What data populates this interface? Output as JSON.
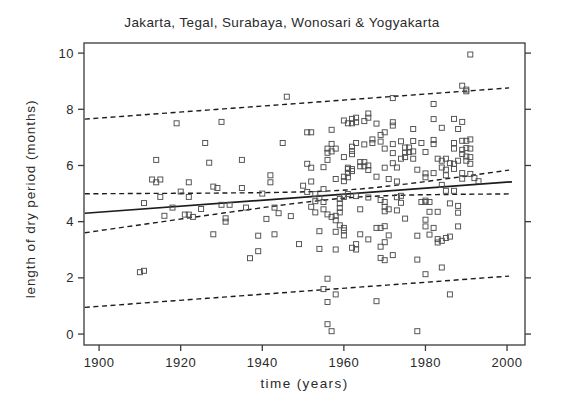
{
  "chart_data": {
    "type": "scatter",
    "title": "Jakarta, Tegal, Surabaya, Wonosari & Yogyakarta",
    "xlabel": "time (years)",
    "ylabel": "length of dry period (months)",
    "x_ticks": [
      1900,
      1920,
      1940,
      1960,
      1980,
      2000
    ],
    "y_ticks": [
      0,
      2,
      4,
      6,
      8,
      10
    ],
    "xlim": [
      1896.3,
      2004.4
    ],
    "ylim": [
      -0.39,
      10.36
    ],
    "grid": false,
    "legend": "none",
    "marker": {
      "shape": "open-square",
      "size": 5,
      "color": "#4f4f4f"
    },
    "colors": {
      "frame": "#3a3a3a",
      "fit_line": "#1c1c1c",
      "band_line": "#1c1c1c",
      "text": "#2a2a2a",
      "background": "#ffffff"
    },
    "fit_line": {
      "x": [
        1896.5,
        2001.2
      ],
      "y": [
        4.3,
        5.42
      ],
      "style": "solid"
    },
    "confidence_band": {
      "style": "dashed",
      "center_year": 1962,
      "a": 0.02,
      "b": 0.000108,
      "upper_at": {
        "1900": 5.0,
        "1960": 5.12,
        "2000": 5.83
      },
      "lower_at": {
        "1900": 3.67,
        "1960": 4.84,
        "2000": 5.0
      }
    },
    "prediction_band": {
      "style": "dashed",
      "offset": 3.35,
      "upper_at": {
        "1900": 7.7,
        "2000": 8.72
      },
      "lower_at": {
        "1900": 0.95,
        "2000": 2.08
      }
    },
    "band_x_range": [
      1896.5,
      2001.2
    ],
    "points": [
      [
        1910,
        2.2
      ],
      [
        1911,
        2.25
      ],
      [
        1911,
        4.66
      ],
      [
        1913,
        5.5
      ],
      [
        1914,
        5.4
      ],
      [
        1914,
        6.2
      ],
      [
        1915,
        5.5
      ],
      [
        1915,
        4.88
      ],
      [
        1916,
        4.21
      ],
      [
        1918,
        4.5
      ],
      [
        1919,
        7.5
      ],
      [
        1920,
        5.07
      ],
      [
        1921,
        4.25
      ],
      [
        1922,
        4.25
      ],
      [
        1922,
        4.88
      ],
      [
        1922,
        5.4
      ],
      [
        1923,
        4.17
      ],
      [
        1925,
        4.45
      ],
      [
        1926,
        6.8
      ],
      [
        1927,
        6.1
      ],
      [
        1928,
        5.25
      ],
      [
        1928,
        3.55
      ],
      [
        1929,
        5.2
      ],
      [
        1930,
        7.55
      ],
      [
        1930,
        4.6
      ],
      [
        1931,
        4.12
      ],
      [
        1931,
        4.0
      ],
      [
        1932,
        4.6
      ],
      [
        1935,
        5.2
      ],
      [
        1935,
        6.2
      ],
      [
        1936,
        4.5
      ],
      [
        1937,
        2.7
      ],
      [
        1939,
        3.5
      ],
      [
        1939,
        2.95
      ],
      [
        1940,
        5.0
      ],
      [
        1941,
        4.1
      ],
      [
        1942,
        5.4
      ],
      [
        1942,
        5.65
      ],
      [
        1943,
        3.55
      ],
      [
        1943,
        4.5
      ],
      [
        1944,
        4.3
      ],
      [
        1945,
        6.8
      ],
      [
        1946,
        8.45
      ],
      [
        1947,
        4.2
      ],
      [
        1949,
        3.2
      ],
      [
        1950,
        5.28
      ],
      [
        1951,
        7.18
      ],
      [
        1951,
        6.06
      ],
      [
        1951,
        5.06
      ],
      [
        1952,
        7.18
      ],
      [
        1952,
        5.92
      ],
      [
        1952,
        5.43
      ],
      [
        1952,
        4.53
      ],
      [
        1953,
        4.98
      ],
      [
        1953,
        4.73
      ],
      [
        1953,
        4.33
      ],
      [
        1954,
        4.85
      ],
      [
        1954,
        3.66
      ],
      [
        1954,
        3.03
      ],
      [
        1955,
        4.7
      ],
      [
        1955,
        5.94
      ],
      [
        1955,
        5.16
      ],
      [
        1955,
        4.44
      ],
      [
        1955,
        1.6
      ],
      [
        1956,
        1.14
      ],
      [
        1956,
        0.35
      ],
      [
        1956,
        6.6
      ],
      [
        1956,
        6.45
      ],
      [
        1956,
        6.2
      ],
      [
        1956,
        1.97
      ],
      [
        1956,
        4.26
      ],
      [
        1957,
        0.1
      ],
      [
        1957,
        7.27
      ],
      [
        1957,
        6.77
      ],
      [
        1957,
        6.5
      ],
      [
        1957,
        4.17
      ],
      [
        1958,
        4.21
      ],
      [
        1958,
        4.05
      ],
      [
        1958,
        6.6
      ],
      [
        1958,
        1.41
      ],
      [
        1958,
        3.64
      ],
      [
        1958,
        5.52
      ],
      [
        1958,
        3.01
      ],
      [
        1959,
        4.81
      ],
      [
        1959,
        4.65
      ],
      [
        1959,
        4.49
      ],
      [
        1959,
        4.33
      ],
      [
        1959,
        3.87
      ],
      [
        1960,
        5.6
      ],
      [
        1960,
        5.44
      ],
      [
        1960,
        4.88
      ],
      [
        1960,
        3.69
      ],
      [
        1960,
        6.3
      ],
      [
        1960,
        7.6
      ],
      [
        1960,
        3.78
      ],
      [
        1960,
        3.51
      ],
      [
        1961,
        5.92
      ],
      [
        1961,
        5.87
      ],
      [
        1961,
        5.73
      ],
      [
        1961,
        5.58
      ],
      [
        1961,
        4.98
      ],
      [
        1961,
        7.5
      ],
      [
        1962,
        7.66
      ],
      [
        1962,
        7.5
      ],
      [
        1962,
        6.67
      ],
      [
        1962,
        6.52
      ],
      [
        1962,
        6.4
      ],
      [
        1962,
        5.8
      ],
      [
        1962,
        5.87
      ],
      [
        1962,
        3.07
      ],
      [
        1963,
        7.7
      ],
      [
        1963,
        7.54
      ],
      [
        1963,
        6.8
      ],
      [
        1963,
        4.91
      ],
      [
        1963,
        3.2
      ],
      [
        1963,
        3.01
      ],
      [
        1964,
        6.12
      ],
      [
        1964,
        5.97
      ],
      [
        1964,
        3.55
      ],
      [
        1964,
        4.44
      ],
      [
        1965,
        6.75
      ],
      [
        1965,
        7.58
      ],
      [
        1965,
        6.12
      ],
      [
        1965,
        5.97
      ],
      [
        1966,
        7.85
      ],
      [
        1966,
        7.7
      ],
      [
        1966,
        6.0
      ],
      [
        1966,
        5.84
      ],
      [
        1966,
        3.37
      ],
      [
        1966,
        4.86
      ],
      [
        1967,
        6.93
      ],
      [
        1967,
        6.8
      ],
      [
        1968,
        7.49
      ],
      [
        1968,
        3.78
      ],
      [
        1968,
        5.6
      ],
      [
        1968,
        1.17
      ],
      [
        1969,
        7.09
      ],
      [
        1969,
        6.85
      ],
      [
        1969,
        3.78
      ],
      [
        1969,
        3.11
      ],
      [
        1969,
        2.71
      ],
      [
        1969,
        4.77
      ],
      [
        1970,
        7.18
      ],
      [
        1970,
        6.6
      ],
      [
        1970,
        5.92
      ],
      [
        1970,
        3.84
      ],
      [
        1970,
        3.27
      ],
      [
        1970,
        2.63
      ],
      [
        1970,
        4.7
      ],
      [
        1970,
        4.53
      ],
      [
        1970,
        4.37
      ],
      [
        1971,
        5.52
      ],
      [
        1971,
        3.51
      ],
      [
        1971,
        4.44
      ],
      [
        1972,
        7.42
      ],
      [
        1972,
        7.54
      ],
      [
        1972,
        8.4
      ],
      [
        1972,
        6.76
      ],
      [
        1972,
        6.44
      ],
      [
        1972,
        6.08
      ],
      [
        1972,
        2.81
      ],
      [
        1973,
        5.93
      ],
      [
        1973,
        5.43
      ],
      [
        1973,
        4.87
      ],
      [
        1973,
        4.4
      ],
      [
        1974,
        6.86
      ],
      [
        1974,
        6.24
      ],
      [
        1974,
        4.92
      ],
      [
        1974,
        4.67
      ],
      [
        1975,
        6.64
      ],
      [
        1975,
        6.45
      ],
      [
        1975,
        6.3
      ],
      [
        1975,
        4.11
      ],
      [
        1976,
        6.64
      ],
      [
        1976,
        6.48
      ],
      [
        1977,
        6.5
      ],
      [
        1977,
        6.24
      ],
      [
        1977,
        7.3
      ],
      [
        1977,
        6.87
      ],
      [
        1978,
        5.85
      ],
      [
        1978,
        3.5
      ],
      [
        1978,
        2.65
      ],
      [
        1978,
        0.1
      ],
      [
        1979,
        6.8
      ],
      [
        1979,
        4.7
      ],
      [
        1980,
        4.75
      ],
      [
        1980,
        4.7
      ],
      [
        1981,
        4.7
      ],
      [
        1980,
        3.83
      ],
      [
        1980,
        2.13
      ],
      [
        1980,
        5.72
      ],
      [
        1980,
        4.07
      ],
      [
        1980,
        6.48
      ],
      [
        1980,
        5.58
      ],
      [
        1982,
        6.91
      ],
      [
        1982,
        6.76
      ],
      [
        1982,
        8.19
      ],
      [
        1982,
        7.65
      ],
      [
        1982,
        3.78
      ],
      [
        1982,
        5.73
      ],
      [
        1981,
        4.35
      ],
      [
        1981,
        3.54
      ],
      [
        1983,
        6.24
      ],
      [
        1983,
        4.35
      ],
      [
        1983,
        3.38
      ],
      [
        1983,
        3.26
      ],
      [
        1984,
        7.34
      ],
      [
        1984,
        5.93
      ],
      [
        1984,
        6.17
      ],
      [
        1984,
        2.37
      ],
      [
        1984,
        3.32
      ],
      [
        1984,
        5.31
      ],
      [
        1985,
        3.42
      ],
      [
        1985,
        5.85
      ],
      [
        1985,
        6.24
      ],
      [
        1985,
        5.65
      ],
      [
        1985,
        5.1
      ],
      [
        1986,
        6.08
      ],
      [
        1986,
        1.41
      ],
      [
        1986,
        3.47
      ],
      [
        1986,
        4.65
      ],
      [
        1987,
        6.8
      ],
      [
        1987,
        6.6
      ],
      [
        1987,
        6.06
      ],
      [
        1987,
        5.88
      ],
      [
        1987,
        7.66
      ],
      [
        1987,
        5.1
      ],
      [
        1988,
        6.17
      ],
      [
        1988,
        4.56
      ],
      [
        1988,
        4.32
      ],
      [
        1988,
        3.83
      ],
      [
        1988,
        7.3
      ],
      [
        1989,
        8.84
      ],
      [
        1989,
        6.88
      ],
      [
        1989,
        6.56
      ],
      [
        1989,
        6.41
      ],
      [
        1989,
        5.53
      ],
      [
        1989,
        7.55
      ],
      [
        1989,
        5.73
      ],
      [
        1990,
        8.7
      ],
      [
        1990,
        8.64
      ],
      [
        1990,
        6.88
      ],
      [
        1990,
        6.62
      ],
      [
        1990,
        6.32
      ],
      [
        1990,
        6.17
      ],
      [
        1991,
        9.95
      ],
      [
        1991,
        6.93
      ],
      [
        1991,
        6.6
      ],
      [
        1991,
        6.3
      ],
      [
        1991,
        6.06
      ],
      [
        1991,
        5.7
      ],
      [
        1992,
        5.55
      ],
      [
        1993,
        5.44
      ]
    ]
  }
}
